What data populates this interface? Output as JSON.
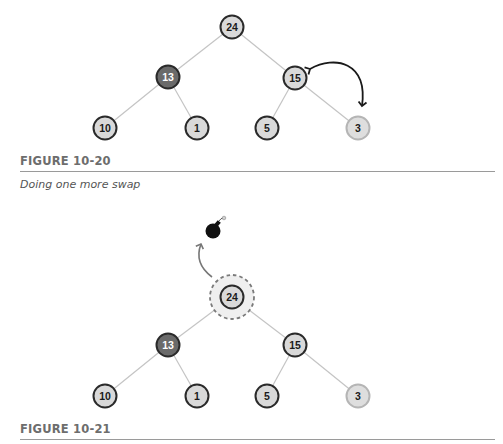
{
  "figures": [
    {
      "label": "FIGURE 10-20",
      "caption": "Doing one more swap",
      "tree": {
        "nodes": [
          {
            "id": "n24",
            "value": "24",
            "style": "normal"
          },
          {
            "id": "n13",
            "value": "13",
            "style": "dark"
          },
          {
            "id": "n15",
            "value": "15",
            "style": "normal"
          },
          {
            "id": "n10",
            "value": "10",
            "style": "normal"
          },
          {
            "id": "n1",
            "value": "1",
            "style": "normal"
          },
          {
            "id": "n5",
            "value": "5",
            "style": "normal"
          },
          {
            "id": "n3",
            "value": "3",
            "style": "faded"
          }
        ],
        "edges": [
          [
            "24",
            "13"
          ],
          [
            "24",
            "15"
          ],
          [
            "13",
            "10"
          ],
          [
            "13",
            "1"
          ],
          [
            "15",
            "5"
          ],
          [
            "15",
            "3"
          ]
        ],
        "annotation": "swap-arrow between 15 and 3"
      }
    },
    {
      "label": "FIGURE 10-21",
      "caption": "",
      "tree": {
        "nodes": [
          {
            "id": "n24",
            "value": "24",
            "style": "highlighted-dashed"
          },
          {
            "id": "n13",
            "value": "13",
            "style": "dark"
          },
          {
            "id": "n15",
            "value": "15",
            "style": "normal"
          },
          {
            "id": "n10",
            "value": "10",
            "style": "normal"
          },
          {
            "id": "n1",
            "value": "1",
            "style": "normal"
          },
          {
            "id": "n5",
            "value": "5",
            "style": "normal"
          },
          {
            "id": "n3",
            "value": "3",
            "style": "faded"
          }
        ],
        "edges": [
          [
            "24",
            "13"
          ],
          [
            "24",
            "15"
          ],
          [
            "13",
            "10"
          ],
          [
            "13",
            "1"
          ],
          [
            "15",
            "5"
          ],
          [
            "15",
            "3"
          ]
        ],
        "annotation": "bomb icon with arrow from root 24"
      }
    }
  ],
  "colors": {
    "node_fill": "#d9d9d9",
    "node_stroke": "#2a2a2a",
    "dark_fill": "#6a6a6a",
    "faded_stroke": "#b5b5b5",
    "edge": "#c4c4c4",
    "label": "#6d6d6d"
  }
}
